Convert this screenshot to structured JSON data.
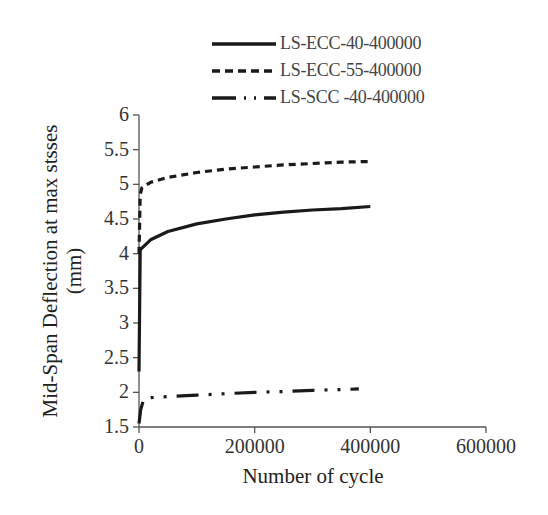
{
  "chart_data": {
    "type": "line",
    "title": "",
    "xlabel": "Number of cycle",
    "ylabel": "Mid-Span Deflection at max stsses (mm)",
    "ylabel_lines": [
      "Mid-Span Deflection at max stsses",
      "(mm)"
    ],
    "xlim": [
      0,
      600000
    ],
    "ylim": [
      1.5,
      6
    ],
    "x_ticks": [
      "0",
      "200000",
      "400000",
      "600000"
    ],
    "y_ticks": [
      "1.5",
      "2",
      "2.5",
      "3",
      "3.5",
      "4",
      "4.5",
      "5",
      "5.5",
      "6"
    ],
    "grid": false,
    "legend_position": "top",
    "series": [
      {
        "name": "LS-ECC-40-400000",
        "style": "solid",
        "x": [
          0,
          2000,
          5000,
          10000,
          20000,
          50000,
          100000,
          150000,
          200000,
          250000,
          300000,
          350000,
          400000
        ],
        "y": [
          2.3,
          4.05,
          4.08,
          4.12,
          4.2,
          4.32,
          4.43,
          4.5,
          4.56,
          4.6,
          4.63,
          4.65,
          4.68
        ]
      },
      {
        "name": "LS-ECC-55-400000",
        "style": "dashed",
        "x": [
          0,
          2000,
          5000,
          10000,
          20000,
          50000,
          100000,
          150000,
          200000,
          250000,
          300000,
          350000,
          400000
        ],
        "y": [
          4.0,
          4.85,
          4.95,
          4.98,
          5.03,
          5.1,
          5.17,
          5.22,
          5.25,
          5.28,
          5.3,
          5.32,
          5.33
        ]
      },
      {
        "name": "LS-SCC -40-400000",
        "style": "dash-dot-dot",
        "x": [
          0,
          3000,
          8000,
          15000,
          50000,
          100000,
          150000,
          200000,
          250000,
          300000,
          350000,
          380000
        ],
        "y": [
          1.55,
          1.75,
          1.9,
          1.92,
          1.94,
          1.96,
          1.98,
          2.0,
          2.01,
          2.03,
          2.04,
          2.05
        ]
      }
    ]
  },
  "colors": {
    "line": "#1a1a1a",
    "axis": "#555555"
  }
}
